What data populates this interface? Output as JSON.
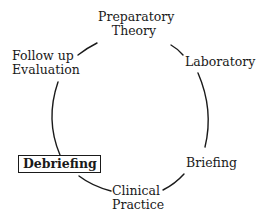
{
  "diagram": {
    "type": "cycle",
    "nodes": [
      {
        "id": "preparatory-theory",
        "lines": [
          "Preparatory",
          "Theory"
        ],
        "highlighted": false
      },
      {
        "id": "laboratory",
        "lines": [
          "Laboratory"
        ],
        "highlighted": false
      },
      {
        "id": "briefing",
        "lines": [
          "Briefing"
        ],
        "highlighted": false
      },
      {
        "id": "clinical-practice",
        "lines": [
          "Clinical",
          "Practice"
        ],
        "highlighted": false
      },
      {
        "id": "debriefing",
        "lines": [
          "Debriefing"
        ],
        "highlighted": true
      },
      {
        "id": "follow-up-evaluation",
        "lines": [
          "Follow up",
          "Evaluation"
        ],
        "highlighted": false
      }
    ],
    "edges": [
      [
        "preparatory-theory",
        "laboratory"
      ],
      [
        "laboratory",
        "briefing"
      ],
      [
        "briefing",
        "clinical-practice"
      ],
      [
        "clinical-practice",
        "debriefing"
      ],
      [
        "debriefing",
        "follow-up-evaluation"
      ],
      [
        "follow-up-evaluation",
        "preparatory-theory"
      ]
    ],
    "line_color": "#1a1a1a"
  }
}
